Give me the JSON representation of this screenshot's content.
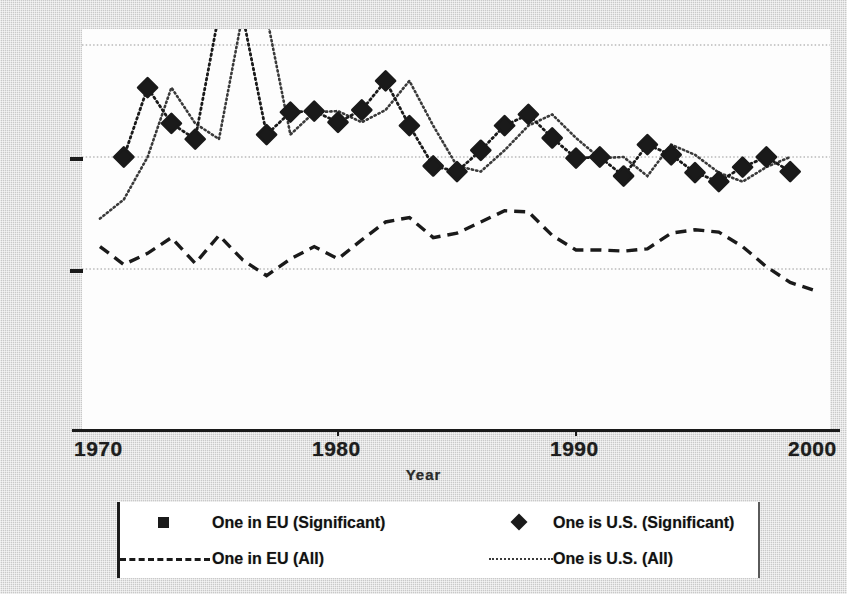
{
  "chart_data": {
    "type": "line",
    "title": "",
    "xlabel": "Year",
    "ylabel": "",
    "xlim": [
      1970,
      2000
    ],
    "ylim": [
      0,
      4
    ],
    "grid": true,
    "gridlines_y": [
      1,
      2,
      3
    ],
    "xticks": [
      1970,
      1980,
      1990,
      2000
    ],
    "xticklabels": [
      "1970",
      "1980",
      "1990",
      "2000"
    ],
    "yticks": [
      1,
      2
    ],
    "yticklabels": [
      "",
      ""
    ],
    "legend_position": "below",
    "series": [
      {
        "name": "One in EU (Significant)",
        "marker": "square",
        "linestyle": "none",
        "color": "#1a1a1a",
        "x": [],
        "values": []
      },
      {
        "name": "One is U.S. (Significant)",
        "marker": "diamond",
        "linestyle": "dotted",
        "color": "#1a1a1a",
        "x": [
          1971,
          1972,
          1973,
          1974,
          1975,
          1976,
          1977,
          1978,
          1979,
          1980,
          1981,
          1982,
          1983,
          1984,
          1985,
          1986,
          1987,
          1988,
          1989,
          1990,
          1991,
          1992,
          1993,
          1994,
          1995,
          1996,
          1997,
          1998,
          1999
        ],
        "values": [
          2.0,
          2.62,
          2.3,
          2.16,
          3.28,
          3.26,
          2.2,
          2.4,
          2.41,
          2.31,
          2.42,
          2.68,
          2.28,
          1.92,
          1.87,
          2.06,
          2.28,
          2.38,
          2.17,
          1.99,
          2.0,
          1.83,
          2.11,
          2.02,
          1.86,
          1.78,
          1.91,
          2.0,
          1.87
        ]
      },
      {
        "name": "One in EU (All)",
        "marker": "none",
        "linestyle": "dashed",
        "color": "#1a1a1a",
        "x": [
          1970,
          1971,
          1972,
          1973,
          1974,
          1975,
          1976,
          1977,
          1978,
          1979,
          1980,
          1981,
          1982,
          1983,
          1984,
          1985,
          1986,
          1987,
          1988,
          1989,
          1990,
          1991,
          1992,
          1993,
          1994,
          1995,
          1996,
          1997,
          1998,
          1999,
          2000
        ],
        "values": [
          1.2,
          1.04,
          1.14,
          1.28,
          1.05,
          1.3,
          1.08,
          0.94,
          1.09,
          1.2,
          1.09,
          1.26,
          1.42,
          1.46,
          1.28,
          1.32,
          1.42,
          1.52,
          1.51,
          1.3,
          1.17,
          1.17,
          1.16,
          1.18,
          1.32,
          1.35,
          1.33,
          1.2,
          1.02,
          0.88,
          0.81
        ]
      },
      {
        "name": "One is U.S. (All)",
        "marker": "none",
        "linestyle": "dotted",
        "color": "#3a3a3a",
        "x": [
          1970,
          1971,
          1972,
          1973,
          1974,
          1975,
          1976,
          1977,
          1978,
          1979,
          1980,
          1981,
          1982,
          1983,
          1984,
          1985,
          1986,
          1987,
          1988,
          1989,
          1990,
          1991,
          1992,
          1993,
          1994,
          1995,
          1996,
          1997,
          1998,
          1999
        ],
        "values": [
          1.45,
          1.62,
          2.0,
          2.62,
          2.3,
          2.16,
          3.28,
          3.26,
          2.2,
          2.4,
          2.41,
          2.31,
          2.42,
          2.68,
          2.28,
          1.92,
          1.87,
          2.06,
          2.28,
          2.38,
          2.17,
          1.99,
          2.0,
          1.83,
          2.11,
          2.02,
          1.86,
          1.78,
          1.91,
          2.0
        ]
      }
    ]
  },
  "axis": {
    "x_title": "Year",
    "ticks": [
      {
        "label": "1970",
        "value": 1970
      },
      {
        "label": "1980",
        "value": 1980
      },
      {
        "label": "1990",
        "value": 1990
      },
      {
        "label": "2000",
        "value": 2000
      }
    ]
  },
  "legend": {
    "entries": [
      {
        "label": "One in EU (Significant)",
        "key": "square-marker",
        "column": 1,
        "row": 1
      },
      {
        "label": "One is U.S. (Significant)",
        "key": "diamond-marker",
        "column": 2,
        "row": 1
      },
      {
        "label": "One in EU (All)",
        "key": "dashed-line",
        "column": 1,
        "row": 2
      },
      {
        "label": "One is U.S. (All)",
        "key": "dotted-line",
        "column": 2,
        "row": 2
      }
    ]
  },
  "colors": {
    "ink": "#1a1a1a",
    "grid": "#b9b9b9",
    "panel": "#fdfdfd",
    "background": "#c9c9c9"
  }
}
